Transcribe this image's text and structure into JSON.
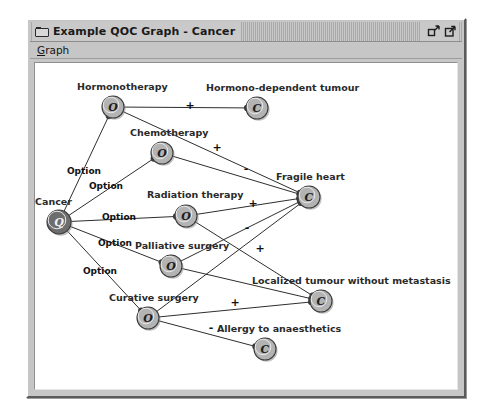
{
  "window": {
    "title": "Example QOC Graph - Cancer",
    "app_icon": "window-mini-icon",
    "buttons": [
      {
        "name": "restore-button",
        "icon": "restore-icon"
      },
      {
        "name": "maximize-button",
        "icon": "maximize-icon"
      }
    ]
  },
  "menubar": {
    "items": [
      {
        "label": "Graph",
        "mnemonic": "G"
      }
    ]
  },
  "colors": {
    "question_fill": "#6d6d6d",
    "option_fill": "#b3b3b3",
    "criterion_fill": "#b3b3b3",
    "node_stroke": "#3a3a3a",
    "edge": "#2e2e2e",
    "canvas_bg": "#ffffff",
    "window_bg": "#c6c6c6"
  },
  "graph": {
    "type": "qoc-design-space",
    "nodes": [
      {
        "id": "cancer",
        "label": "Cancer",
        "glyph": "Q",
        "kind": "question",
        "x": 55,
        "y": 217,
        "r": 12,
        "label_x": 31,
        "label_y": 200,
        "anchor": "start"
      },
      {
        "id": "hormono",
        "label": "Hormonotherapy",
        "glyph": "O",
        "kind": "option",
        "x": 109,
        "y": 102,
        "r": 11,
        "label_x": 73,
        "label_y": 85,
        "anchor": "start"
      },
      {
        "id": "chemo",
        "label": "Chemotherapy",
        "glyph": "O",
        "kind": "option",
        "x": 158,
        "y": 148,
        "r": 11,
        "label_x": 126,
        "label_y": 131,
        "anchor": "start"
      },
      {
        "id": "radiation",
        "label": "Radiation therapy",
        "glyph": "O",
        "kind": "option",
        "x": 182,
        "y": 211,
        "r": 11,
        "label_x": 143,
        "label_y": 193,
        "anchor": "start"
      },
      {
        "id": "palliative",
        "label": "Palliative surgery",
        "glyph": "O",
        "kind": "option",
        "x": 167,
        "y": 261,
        "r": 11,
        "label_x": 131,
        "label_y": 244,
        "anchor": "start"
      },
      {
        "id": "curative",
        "label": "Curative surgery",
        "glyph": "O",
        "kind": "option",
        "x": 144,
        "y": 313,
        "r": 11,
        "label_x": 105,
        "label_y": 296,
        "anchor": "start"
      },
      {
        "id": "hormonodep",
        "label": "Hormono-dependent tumour",
        "glyph": "C",
        "kind": "criterion",
        "x": 253,
        "y": 103,
        "r": 11,
        "label_x": 202,
        "label_y": 86,
        "anchor": "start"
      },
      {
        "id": "fragileheart",
        "label": "Fragile heart",
        "glyph": "C",
        "kind": "criterion",
        "x": 305,
        "y": 192,
        "r": 11,
        "label_x": 272,
        "label_y": 175,
        "anchor": "start"
      },
      {
        "id": "localized",
        "label": "Localized tumour without metastasis",
        "glyph": "C",
        "kind": "criterion",
        "x": 317,
        "y": 296,
        "r": 11,
        "label_x": 248,
        "label_y": 279,
        "anchor": "start"
      },
      {
        "id": "allergy",
        "label": "Allergy to anaesthetics",
        "glyph": "C",
        "kind": "criterion",
        "x": 261,
        "y": 344,
        "r": 11,
        "label_x": 213,
        "label_y": 327,
        "anchor": "start"
      }
    ],
    "edges": [
      {
        "from": "cancer",
        "to": "hormono",
        "label": "Option",
        "label_x": 80,
        "label_y": 169,
        "kind": "option-link"
      },
      {
        "from": "cancer",
        "to": "chemo",
        "label": "Option",
        "label_x": 102,
        "label_y": 184,
        "kind": "option-link"
      },
      {
        "from": "cancer",
        "to": "radiation",
        "label": "Option",
        "label_x": 115,
        "label_y": 215,
        "kind": "option-link"
      },
      {
        "from": "cancer",
        "to": "palliative",
        "label": "Option",
        "label_x": 111,
        "label_y": 241,
        "kind": "option-link"
      },
      {
        "from": "cancer",
        "to": "curative",
        "label": "Option",
        "label_x": 96,
        "label_y": 269,
        "kind": "option-link"
      },
      {
        "from": "hormono",
        "to": "hormonodep",
        "label": "+",
        "label_x": 186,
        "label_y": 104,
        "kind": "assessment"
      },
      {
        "from": "chemo",
        "to": "fragileheart",
        "label": "-",
        "label_x": 242,
        "label_y": 167,
        "kind": "assessment"
      },
      {
        "from": "hormono",
        "to": "fragileheart",
        "label": "+",
        "label_x": 213,
        "label_y": 146,
        "kind": "assessment"
      },
      {
        "from": "radiation",
        "to": "fragileheart",
        "label": "+",
        "label_x": 249,
        "label_y": 202,
        "kind": "assessment"
      },
      {
        "from": "palliative",
        "to": "fragileheart",
        "label": "-",
        "label_x": 243,
        "label_y": 226,
        "kind": "assessment"
      },
      {
        "from": "curative",
        "to": "fragileheart",
        "label": "",
        "label_x": 0,
        "label_y": 0,
        "kind": "assessment"
      },
      {
        "from": "radiation",
        "to": "localized",
        "label": "",
        "label_x": 0,
        "label_y": 0,
        "kind": "assessment"
      },
      {
        "from": "palliative",
        "to": "localized",
        "label": "+",
        "label_x": 256,
        "label_y": 247,
        "kind": "assessment"
      },
      {
        "from": "curative",
        "to": "localized",
        "label": "+",
        "label_x": 231,
        "label_y": 301,
        "kind": "assessment"
      },
      {
        "from": "curative",
        "to": "allergy",
        "label": "-",
        "label_x": 207,
        "label_y": 326,
        "kind": "assessment"
      }
    ]
  }
}
